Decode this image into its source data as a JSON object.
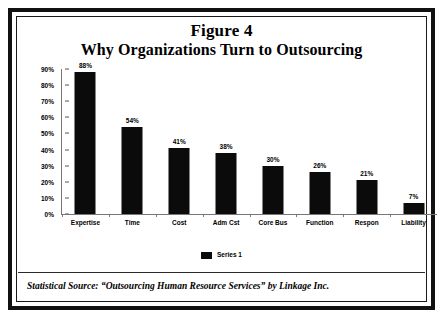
{
  "figure": {
    "title_line_1": "Figure 4",
    "title_line_2": "Why Organizations Turn to Outsourcing",
    "caption": "Statistical Source: “Outsourcing Human Resource Services” by Linkage Inc."
  },
  "chart_data": {
    "type": "bar",
    "title": "Why Organizations Turn to Outsourcing",
    "subtitle": "Figure 4",
    "xlabel": "",
    "ylabel": "",
    "ylim": [
      0,
      90
    ],
    "grid": false,
    "legend_position": "bottom",
    "categories": [
      "Expertise",
      "Time",
      "Cost",
      "Adm Cst",
      "Core Bus",
      "Function",
      "Respon",
      "Liability"
    ],
    "values": [
      88,
      54,
      41,
      38,
      30,
      26,
      21,
      7
    ],
    "value_labels": [
      "88%",
      "54%",
      "41%",
      "38%",
      "30%",
      "26%",
      "21%",
      "7%"
    ],
    "series": [
      {
        "name": "Series 1",
        "color": "#0b0b0b",
        "values": [
          88,
          54,
          41,
          38,
          30,
          26,
          21,
          7
        ]
      }
    ],
    "y_ticks": [
      0,
      10,
      20,
      30,
      40,
      50,
      60,
      70,
      80,
      90
    ],
    "y_tick_labels": [
      "0%",
      "10%",
      "20%",
      "30%",
      "40%",
      "50%",
      "60%",
      "70%",
      "80%",
      "90%"
    ],
    "annotations": [
      "Statistical Source: “Outsourcing Human Resource Services” by Linkage Inc."
    ]
  },
  "legend": {
    "entries": [
      {
        "label": "Series 1",
        "color": "#0b0b0b"
      }
    ]
  },
  "colors": {
    "bar": "#0b0b0b",
    "frame": "#111111",
    "axis": "#777777",
    "background": "#ffffff"
  }
}
